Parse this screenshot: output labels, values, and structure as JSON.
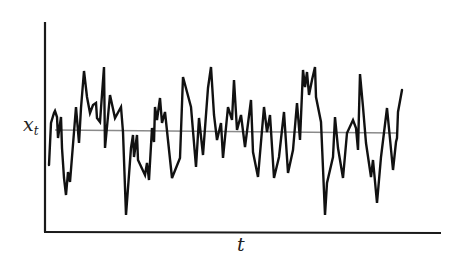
{
  "chart_data": {
    "type": "line",
    "title": "",
    "xlabel": "t",
    "ylabel": "x",
    "ylabel_subscript": "t",
    "grid": false,
    "legend": null,
    "axis_ticks": {
      "x": [],
      "y": []
    },
    "note": "Stationary time series fluctuating around a constant mean (grey horizontal line). Values are pixel-relative: y measured upward from x-axis baseline (0 = axis, ~210 = top of y-axis).",
    "mean_level": 100,
    "series": [
      {
        "name": "x_t",
        "color": "#111111",
        "points": [
          [
            49,
            67
          ],
          [
            51,
            109
          ],
          [
            54,
            119
          ],
          [
            55,
            121
          ],
          [
            57,
            115
          ],
          [
            58,
            94
          ],
          [
            61,
            115
          ],
          [
            62,
            84
          ],
          [
            64,
            54
          ],
          [
            66,
            37
          ],
          [
            68,
            60
          ],
          [
            70,
            50
          ],
          [
            74,
            100
          ],
          [
            76,
            125
          ],
          [
            79,
            89
          ],
          [
            81,
            124
          ],
          [
            84,
            161
          ],
          [
            87,
            135
          ],
          [
            90,
            119
          ],
          [
            93,
            127
          ],
          [
            96,
            129
          ],
          [
            97,
            114
          ],
          [
            100,
            110
          ],
          [
            104,
            165
          ],
          [
            105,
            84
          ],
          [
            110,
            137
          ],
          [
            115,
            114
          ],
          [
            121,
            125
          ],
          [
            123,
            100
          ],
          [
            126,
            17
          ],
          [
            131,
            84
          ],
          [
            133,
            97
          ],
          [
            134,
            75
          ],
          [
            137,
            97
          ],
          [
            138,
            72
          ],
          [
            145,
            57
          ],
          [
            147,
            69
          ],
          [
            149,
            52
          ],
          [
            152,
            104
          ],
          [
            154,
            90
          ],
          [
            155,
            125
          ],
          [
            157,
            112
          ],
          [
            160,
            134
          ],
          [
            162,
            109
          ],
          [
            165,
            120
          ],
          [
            172,
            54
          ],
          [
            180,
            74
          ],
          [
            183,
            155
          ],
          [
            191,
            125
          ],
          [
            196,
            65
          ],
          [
            199,
            114
          ],
          [
            203,
            77
          ],
          [
            208,
            144
          ],
          [
            211,
            165
          ],
          [
            214,
            117
          ],
          [
            217,
            92
          ],
          [
            221,
            109
          ],
          [
            223,
            74
          ],
          [
            228,
            125
          ],
          [
            232,
            112
          ],
          [
            234,
            152
          ],
          [
            237,
            102
          ],
          [
            241,
            117
          ],
          [
            245,
            85
          ],
          [
            251,
            132
          ],
          [
            253,
            80
          ],
          [
            258,
            55
          ],
          [
            264,
            125
          ],
          [
            267,
            100
          ],
          [
            270,
            117
          ],
          [
            274,
            54
          ],
          [
            279,
            75
          ],
          [
            284,
            120
          ],
          [
            288,
            59
          ],
          [
            293,
            82
          ],
          [
            297,
            129
          ],
          [
            300,
            92
          ],
          [
            303,
            162
          ],
          [
            305,
            145
          ],
          [
            307,
            160
          ],
          [
            309,
            137
          ],
          [
            312,
            152
          ],
          [
            315,
            165
          ],
          [
            316,
            135
          ],
          [
            321,
            110
          ],
          [
            325,
            17
          ],
          [
            327,
            49
          ],
          [
            333,
            75
          ],
          [
            335,
            115
          ],
          [
            338,
            84
          ],
          [
            343,
            54
          ],
          [
            347,
            99
          ],
          [
            353,
            112
          ],
          [
            356,
            104
          ],
          [
            358,
            82
          ],
          [
            360,
            158
          ],
          [
            363,
            125
          ],
          [
            366,
            89
          ],
          [
            371,
            55
          ],
          [
            373,
            72
          ],
          [
            377,
            29
          ],
          [
            381,
            75
          ],
          [
            387,
            124
          ],
          [
            393,
            62
          ],
          [
            396,
            90
          ],
          [
            397,
            94
          ],
          [
            398,
            120
          ],
          [
            402,
            142
          ]
        ]
      },
      {
        "name": "mean",
        "color": "#8a8a8a",
        "points": [
          [
            55,
            102
          ],
          [
            396,
            99
          ]
        ]
      }
    ]
  },
  "labels": {
    "y_axis_main": "x",
    "y_axis_sub": "t",
    "x_axis": "t"
  },
  "colors": {
    "series": "#111111",
    "mean_line": "#8a8a8a",
    "axis": "#1a1a1a",
    "background": "#ffffff"
  }
}
